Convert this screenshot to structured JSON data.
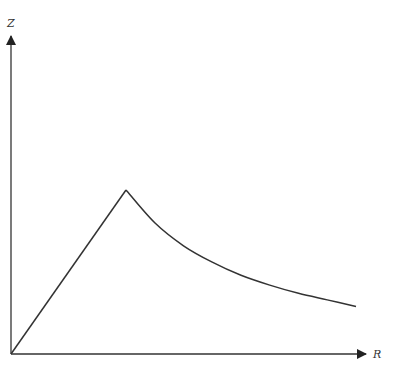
{
  "diagram": {
    "type": "line",
    "axes": {
      "x_label": "R",
      "y_label": "Z"
    },
    "curve": {
      "description": "Linear rise from origin to a peak, then a decaying curve approaching an asymptote",
      "segments": [
        {
          "kind": "linear",
          "from": [
            0,
            0
          ],
          "to": [
            1,
            1
          ]
        },
        {
          "kind": "decay",
          "from": [
            1,
            1
          ],
          "to": [
            3.0,
            0.29
          ]
        }
      ]
    },
    "colors": {
      "line": "#333333",
      "background": "#ffffff"
    }
  },
  "chart_data": {
    "type": "line",
    "title": "",
    "xlabel": "R",
    "ylabel": "Z",
    "grid": false,
    "legend": "none",
    "series": [
      {
        "name": "Z(R)",
        "x": [
          0,
          1,
          1.25,
          1.5,
          1.75,
          2.0,
          2.25,
          2.5,
          2.75,
          3.0
        ],
        "y": [
          0,
          1,
          0.8,
          0.66,
          0.56,
          0.48,
          0.42,
          0.37,
          0.33,
          0.29
        ]
      }
    ],
    "xlim": [
      0,
      3.2
    ],
    "ylim": [
      0,
      2
    ]
  }
}
